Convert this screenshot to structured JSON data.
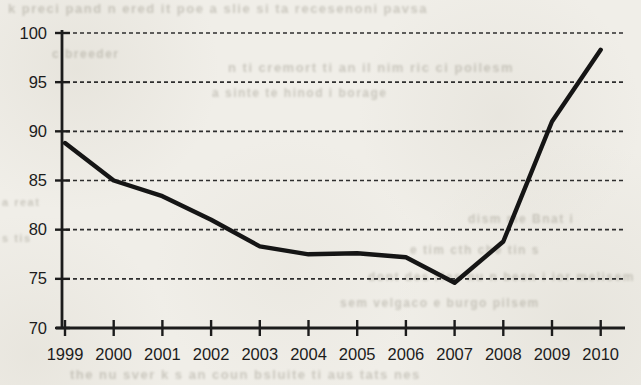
{
  "chart_data": {
    "type": "line",
    "title": "",
    "xlabel": "",
    "ylabel": "",
    "categories": [
      "1999",
      "2000",
      "2001",
      "2002",
      "2003",
      "2004",
      "2005",
      "2006",
      "2007",
      "2008",
      "2009",
      "2010"
    ],
    "series": [
      {
        "name": "value",
        "values": [
          88.8,
          85.0,
          83.4,
          81.0,
          78.3,
          77.5,
          77.6,
          77.2,
          74.6,
          78.8,
          91.0,
          98.3
        ]
      }
    ],
    "ylim": [
      70,
      100
    ],
    "yticks": [
      70,
      75,
      80,
      85,
      90,
      95,
      100
    ],
    "grid": "horizontal-dashed",
    "legend_position": "none"
  },
  "style": {
    "paper_color": "#f0eee8",
    "ink_color": "#1c1c1c",
    "line_color": "#151515",
    "grid_color": "#2e2e2e",
    "bleed_text_color": "#7f7b6c"
  },
  "background_fragments": [
    {
      "text": "k preci pand n ered it poe a slie si ta recesenoni pavsa",
      "x": 8,
      "y": 1,
      "size": 13
    },
    {
      "text": "c breeder",
      "x": 52,
      "y": 47,
      "size": 12
    },
    {
      "text": "n ti cremort ti an il nim ric ci poilesm",
      "x": 228,
      "y": 60,
      "size": 13
    },
    {
      "text": "a sinte te hinod i borage",
      "x": 212,
      "y": 86,
      "size": 12
    },
    {
      "text": "a reat",
      "x": 2,
      "y": 196,
      "size": 11
    },
    {
      "text": "s tis",
      "x": 2,
      "y": 232,
      "size": 11
    },
    {
      "text": "dism me Bnat i",
      "x": 468,
      "y": 212,
      "size": 12
    },
    {
      "text": "e tim cth che tin s",
      "x": 410,
      "y": 243,
      "size": 12
    },
    {
      "text": "dont des rles nu n besn i ior melisem",
      "x": 368,
      "y": 270,
      "size": 12
    },
    {
      "text": "sem velgaco e burgo pilsem",
      "x": 340,
      "y": 296,
      "size": 12
    },
    {
      "text": "the nu sver k s an coun bsluite ti aus tats nes",
      "x": 70,
      "y": 367,
      "size": 13
    }
  ]
}
